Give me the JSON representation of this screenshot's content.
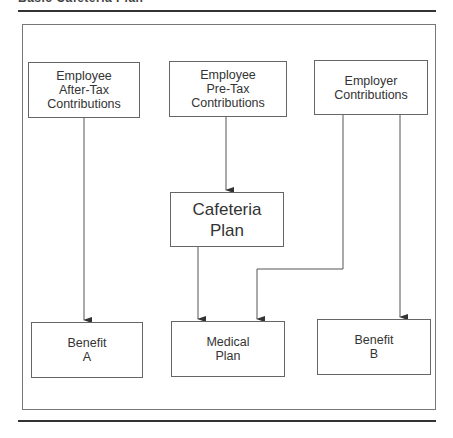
{
  "title": "Basic Cafeteria Plan",
  "nodes": {
    "after_tax": "Employee\nAfter-Tax\nContributions",
    "pre_tax": "Employee\nPre-Tax\nContributions",
    "employer": "Employer\nContributions",
    "cafeteria": "Cafeteria\nPlan",
    "benefit_a": "Benefit\nA",
    "medical": "Medical\nPlan",
    "benefit_b": "Benefit\nB"
  },
  "edges": [
    {
      "from": "after_tax",
      "to": "benefit_a"
    },
    {
      "from": "pre_tax",
      "to": "cafeteria"
    },
    {
      "from": "cafeteria",
      "to": "medical"
    },
    {
      "from": "employer",
      "to": "medical"
    },
    {
      "from": "employer",
      "to": "benefit_b"
    }
  ],
  "colors": {
    "line": "#555555",
    "box_border": "#666666",
    "rule": "#333333"
  }
}
